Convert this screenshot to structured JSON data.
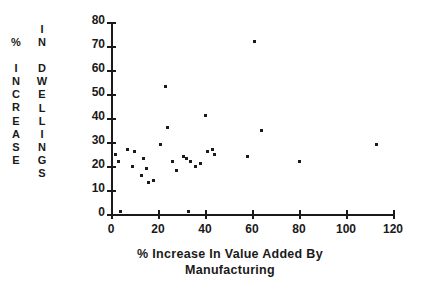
{
  "yaxis_label": {
    "column_1": "%\n\nI\nN\nC\nR\nE\nA\nS\nE",
    "column_2": "I\nN\n\nD\nW\nE\nL\nL\nI\nN\nG\nS"
  },
  "xaxis_title": "% Increase In Value Added By\nManufacturing",
  "chart_data": {
    "type": "scatter",
    "title": "",
    "xlabel": "% Increase In Value Added By Manufacturing",
    "ylabel": "% Increase In Dwellings",
    "xlim": [
      0,
      120
    ],
    "ylim": [
      0,
      80
    ],
    "xticks": [
      0,
      20,
      40,
      60,
      80,
      100,
      120
    ],
    "yticks": [
      0,
      10,
      20,
      30,
      40,
      50,
      60,
      70,
      80
    ],
    "grid": false,
    "legend": null,
    "marker": "square-dot",
    "marker_color": "#1a1a1a",
    "points": [
      {
        "x": 2,
        "y": 25
      },
      {
        "x": 3,
        "y": 22
      },
      {
        "x": 4,
        "y": 1
      },
      {
        "x": 7,
        "y": 27
      },
      {
        "x": 9,
        "y": 20
      },
      {
        "x": 10,
        "y": 26
      },
      {
        "x": 13,
        "y": 16
      },
      {
        "x": 14,
        "y": 23
      },
      {
        "x": 15,
        "y": 19
      },
      {
        "x": 16,
        "y": 13
      },
      {
        "x": 18,
        "y": 14
      },
      {
        "x": 21,
        "y": 29
      },
      {
        "x": 23,
        "y": 53
      },
      {
        "x": 24,
        "y": 36
      },
      {
        "x": 26,
        "y": 22
      },
      {
        "x": 28,
        "y": 18
      },
      {
        "x": 31,
        "y": 24
      },
      {
        "x": 32,
        "y": 23
      },
      {
        "x": 33,
        "y": 1
      },
      {
        "x": 34,
        "y": 22
      },
      {
        "x": 36,
        "y": 20
      },
      {
        "x": 38,
        "y": 21
      },
      {
        "x": 40,
        "y": 41
      },
      {
        "x": 41,
        "y": 26
      },
      {
        "x": 43,
        "y": 27
      },
      {
        "x": 44,
        "y": 25
      },
      {
        "x": 58,
        "y": 24
      },
      {
        "x": 61,
        "y": 72
      },
      {
        "x": 64,
        "y": 35
      },
      {
        "x": 80,
        "y": 22
      },
      {
        "x": 113,
        "y": 29
      }
    ]
  }
}
